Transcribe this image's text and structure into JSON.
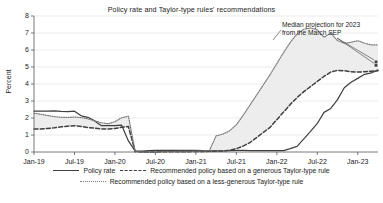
{
  "chart_data": {
    "type": "line",
    "title": "Policy rate and Taylor-type rules' recommendations",
    "xlabel": "",
    "ylabel": "Percent",
    "ylim": [
      0,
      8
    ],
    "yticks": [
      0,
      1,
      2,
      3,
      4,
      5,
      6,
      7,
      8
    ],
    "grid": true,
    "legend_position": "bottom",
    "xtick_labels": [
      "Jan-19",
      "Jul-19",
      "Jan-20",
      "Jul-20",
      "Jan-21",
      "Jul-21",
      "Jan-22",
      "Jul-22",
      "Jan-23"
    ],
    "x": [
      "2019-01",
      "2019-02",
      "2019-03",
      "2019-04",
      "2019-05",
      "2019-06",
      "2019-07",
      "2019-08",
      "2019-09",
      "2019-10",
      "2019-11",
      "2019-12",
      "2020-01",
      "2020-02",
      "2020-03",
      "2020-04",
      "2020-05",
      "2020-06",
      "2020-07",
      "2020-08",
      "2020-09",
      "2020-10",
      "2020-11",
      "2020-12",
      "2021-01",
      "2021-02",
      "2021-03",
      "2021-04",
      "2021-05",
      "2021-06",
      "2021-07",
      "2021-08",
      "2021-09",
      "2021-10",
      "2021-11",
      "2021-12",
      "2022-01",
      "2022-02",
      "2022-03",
      "2022-04",
      "2022-05",
      "2022-06",
      "2022-07",
      "2022-08",
      "2022-09",
      "2022-10",
      "2022-11",
      "2022-12",
      "2023-01",
      "2023-02",
      "2023-03",
      "2023-04"
    ],
    "series": [
      {
        "name": "Policy rate",
        "style": "solid",
        "color": "#3f3f3f",
        "values": [
          2.4,
          2.4,
          2.41,
          2.42,
          2.39,
          2.38,
          2.4,
          2.13,
          2.04,
          1.83,
          1.55,
          1.55,
          1.55,
          1.58,
          0.65,
          0.05,
          0.05,
          0.08,
          0.09,
          0.1,
          0.09,
          0.09,
          0.09,
          0.09,
          0.09,
          0.08,
          0.07,
          0.07,
          0.06,
          0.08,
          0.1,
          0.09,
          0.08,
          0.08,
          0.08,
          0.08,
          0.08,
          0.08,
          0.2,
          0.33,
          0.77,
          1.21,
          1.68,
          2.33,
          2.56,
          3.08,
          3.78,
          4.1,
          4.33,
          4.57,
          4.65,
          4.83
        ]
      },
      {
        "name": "Recommended policy based on a generous Taylor-type rule",
        "style": "dashed",
        "color": "#3f3f3f",
        "values": [
          1.35,
          1.36,
          1.38,
          1.42,
          1.48,
          1.52,
          1.55,
          1.5,
          1.44,
          1.4,
          1.36,
          1.35,
          1.38,
          1.45,
          1.5,
          0.02,
          0.0,
          0.0,
          0.0,
          0.01,
          0.02,
          0.02,
          0.02,
          0.02,
          0.03,
          0.03,
          0.04,
          0.05,
          0.06,
          0.1,
          0.2,
          0.35,
          0.55,
          0.85,
          1.15,
          1.45,
          1.9,
          2.35,
          2.8,
          3.2,
          3.55,
          3.85,
          4.15,
          4.45,
          4.7,
          4.8,
          4.78,
          4.72,
          4.7,
          4.72,
          4.75,
          4.78
        ]
      },
      {
        "name": "Recommended policy based on a less-generous Taylor-type rule",
        "style": "dotted",
        "color": "#7a7a7a",
        "values": [
          2.28,
          2.22,
          2.15,
          2.08,
          2.04,
          2.03,
          2.06,
          2.02,
          1.95,
          1.83,
          1.72,
          1.66,
          1.78,
          2.02,
          2.1,
          0.05,
          0.0,
          0.0,
          0.0,
          0.02,
          0.03,
          0.03,
          0.04,
          0.04,
          0.05,
          0.06,
          0.08,
          0.95,
          1.05,
          1.25,
          1.6,
          2.15,
          2.75,
          3.35,
          3.95,
          4.55,
          5.2,
          5.85,
          6.45,
          6.95,
          7.22,
          7.3,
          7.18,
          6.75,
          7.0,
          6.55,
          6.4,
          6.45,
          6.55,
          6.4,
          6.3,
          6.3
        ]
      }
    ],
    "shaded_band": {
      "description": "area between generous and less-generous Taylor rule recommendations",
      "color": "#ededed"
    },
    "annotation": {
      "line1": "Median projection for 2023",
      "line2": "from the March SEP",
      "markers": [
        {
          "x": "2023-04",
          "y": 5.3
        },
        {
          "x": "2023-04",
          "y": 5.1
        }
      ]
    }
  },
  "legend": {
    "items": [
      {
        "label": "Policy rate",
        "key": "solid"
      },
      {
        "label": "Recommended policy based on a generous Taylor-type rule",
        "key": "dashed"
      },
      {
        "label": "Recommended policy based on a less-generous Taylor-type rule",
        "key": "dotted"
      }
    ]
  }
}
